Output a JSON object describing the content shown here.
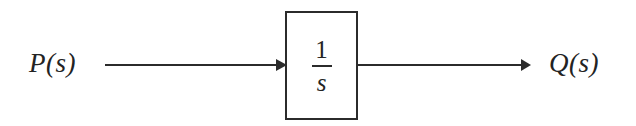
{
  "diagram": {
    "type": "control-system-block-diagram",
    "width": 636,
    "height": 126,
    "background_color": "#ffffff",
    "stroke_color": "#2b2b2b",
    "text_color": "#232323",
    "input": {
      "label": "P(s)",
      "arrow_name": "input-signal-arrow"
    },
    "block": {
      "name": "integrator-block",
      "transfer_function": "1/s",
      "numerator": "1",
      "denominator": "s"
    },
    "output": {
      "label": "Q(s)",
      "arrow_name": "output-signal-arrow"
    }
  }
}
